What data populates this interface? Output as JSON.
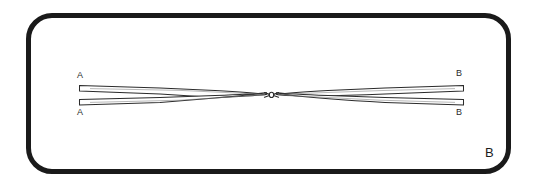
{
  "figure": {
    "panel_letter": "B",
    "frame": {
      "border_color": "#1a1a1a",
      "border_width_px": 5,
      "corner_radius_px": 26,
      "background": "#ffffff"
    },
    "background_color": "#ffffff",
    "ink_color": "#2b2b2b"
  },
  "labels": {
    "a_top": "A",
    "a_bottom": "A",
    "b_top": "B",
    "b_bottom": "B"
  },
  "diagram": {
    "stroke_color": "#2b2b2b",
    "fill_color": "#ffffff",
    "left_end_x": 78,
    "right_end_x": 464,
    "crossing_point_x": 271,
    "crossing_point_y": 95,
    "upper_band_left_y": 88,
    "lower_band_left_y": 102,
    "upper_band_right_y": 88,
    "lower_band_right_y": 102
  }
}
